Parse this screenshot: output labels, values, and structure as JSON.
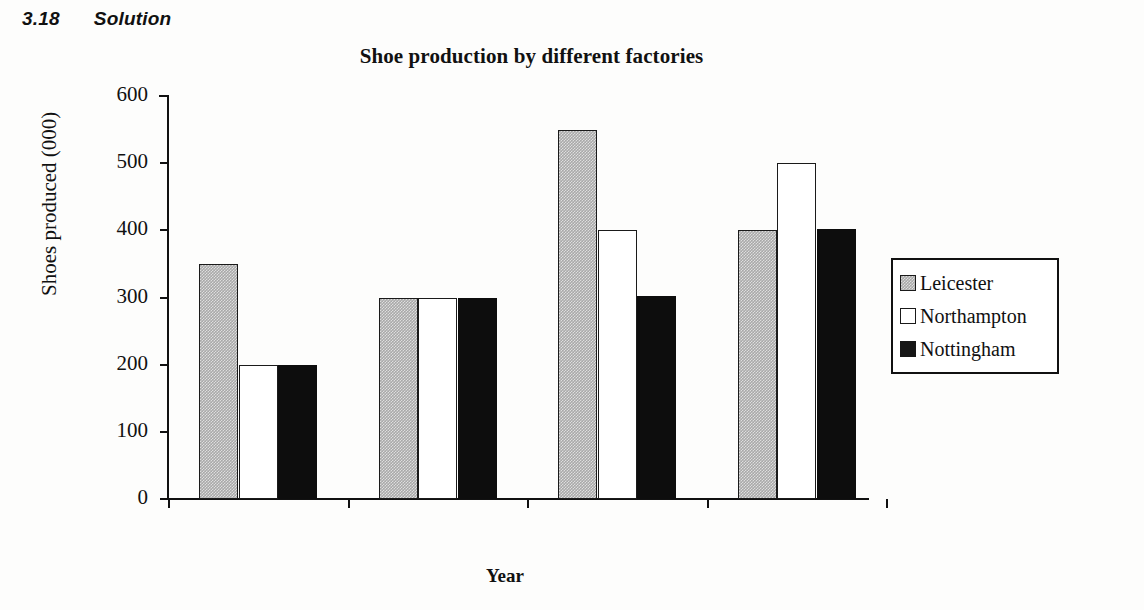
{
  "page": {
    "section_number": "3.18",
    "section_title": "Solution"
  },
  "legend": {
    "position": "right"
  },
  "chart_data": {
    "type": "bar",
    "title": "Shoe production by different factories",
    "xlabel": "Year",
    "ylabel": "Shoes produced (000)",
    "categories": [
      "20X1",
      "20X2",
      "20X3",
      "20X4"
    ],
    "series": [
      {
        "name": "Leicester",
        "values": [
          350,
          300,
          550,
          400
        ]
      },
      {
        "name": "Northampton",
        "values": [
          200,
          300,
          400,
          500
        ]
      },
      {
        "name": "Nottingham",
        "values": [
          200,
          300,
          302,
          402
        ]
      }
    ],
    "ylim": [
      0,
      600
    ],
    "yticks": [
      0,
      100,
      200,
      300,
      400,
      500,
      600
    ],
    "ytick_labels": [
      "0",
      "100",
      "200",
      "300",
      "400",
      "500",
      "600"
    ],
    "grid": false,
    "legend_position": "right",
    "colors": {
      "Leicester": "#a9a9a9",
      "Northampton": "#ffffff",
      "Nottingham": "#0d0d0d",
      "axis": "#111111",
      "background": "#ffffff"
    }
  }
}
